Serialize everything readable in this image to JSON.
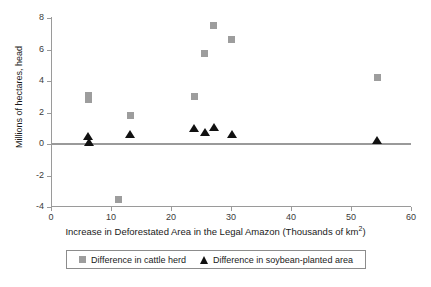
{
  "chart_data": {
    "type": "scatter",
    "title": "",
    "xlabel": "Increase in Deforestated Area in the Legal Amazon (Thousands of km",
    "xlabel_sup": "2",
    "xlabel_tail": ")",
    "ylabel": "Millions of hectares, head",
    "xlim": [
      0,
      60
    ],
    "ylim": [
      -4,
      8
    ],
    "xticks": [
      0,
      10,
      20,
      30,
      40,
      50,
      60
    ],
    "xtick_labels": [
      "0",
      "10",
      "20",
      "30",
      "40",
      "50",
      "60"
    ],
    "yticks": [
      -4,
      -2,
      0,
      2,
      4,
      6,
      8
    ],
    "ytick_labels": [
      "-4",
      "-2",
      "0",
      "2",
      "4",
      "6",
      "8"
    ],
    "grid": false,
    "legend_position": "bottom",
    "zero_line": true,
    "series": [
      {
        "name": "Difference in cattle herd",
        "marker": "square",
        "color": "#9d9d9d",
        "points": [
          {
            "x": 6.2,
            "y": 3.1
          },
          {
            "x": 6.2,
            "y": 2.8
          },
          {
            "x": 11.3,
            "y": -3.55
          },
          {
            "x": 13.2,
            "y": 1.8
          },
          {
            "x": 23.9,
            "y": 3.0
          },
          {
            "x": 25.6,
            "y": 5.75
          },
          {
            "x": 27.0,
            "y": 7.55
          },
          {
            "x": 30.0,
            "y": 6.65
          },
          {
            "x": 54.4,
            "y": 4.2
          }
        ]
      },
      {
        "name": "Difference in soybean-planted area",
        "marker": "triangle",
        "color": "#111111",
        "points": [
          {
            "x": 6.2,
            "y": 0.5
          },
          {
            "x": 6.3,
            "y": 0.15
          },
          {
            "x": 13.2,
            "y": 0.65
          },
          {
            "x": 23.9,
            "y": 1.0
          },
          {
            "x": 25.7,
            "y": 0.75
          },
          {
            "x": 27.1,
            "y": 1.05
          },
          {
            "x": 30.1,
            "y": 0.65
          },
          {
            "x": 54.4,
            "y": 0.25
          }
        ]
      }
    ]
  },
  "legend": {
    "entries": [
      {
        "label": "Difference in cattle herd",
        "marker": "square"
      },
      {
        "label": "Difference in soybean-planted area",
        "marker": "triangle"
      }
    ]
  },
  "colors": {
    "cattle": "#9d9d9d",
    "soybean": "#111111",
    "axis": "#9a9a9a",
    "text": "#1a1a1a",
    "background": "#ffffff"
  }
}
